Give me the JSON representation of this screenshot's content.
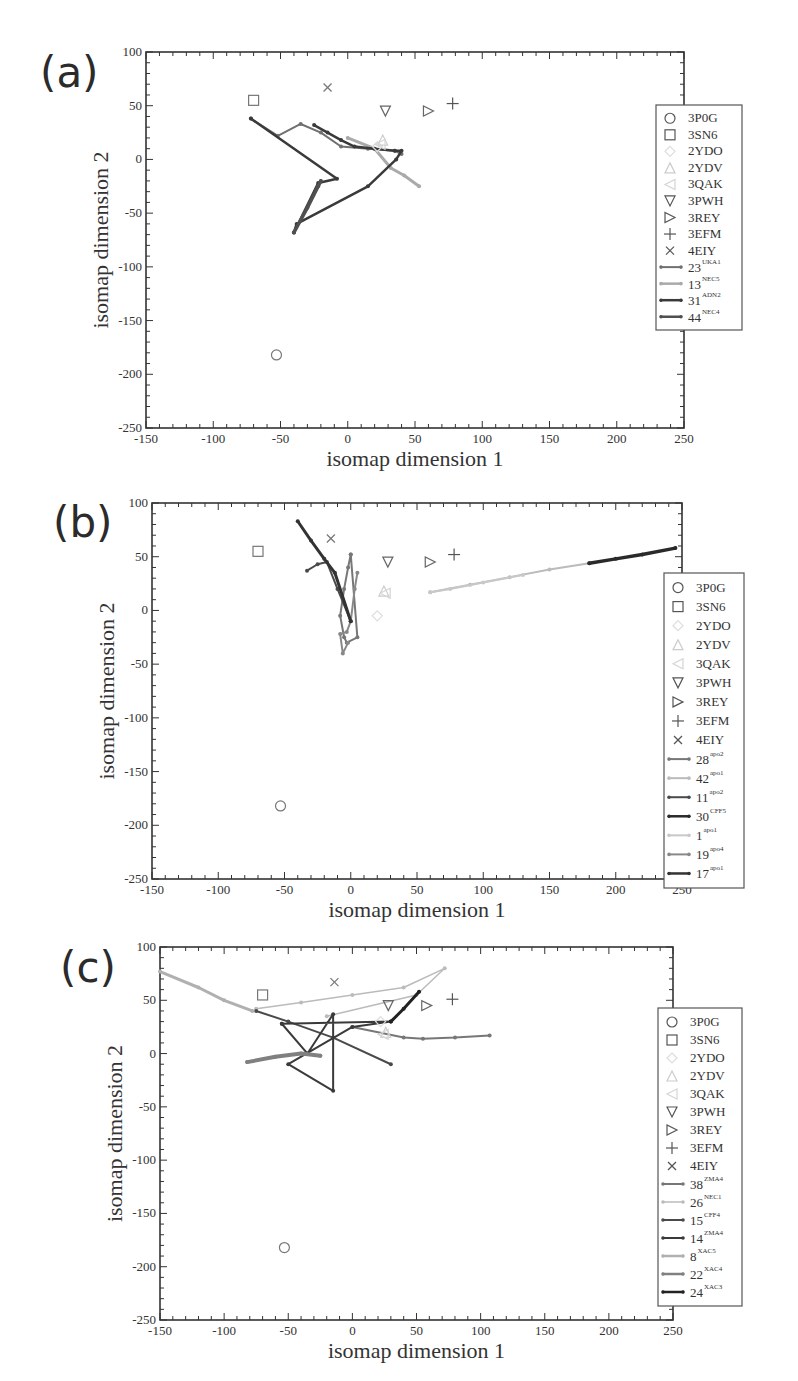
{
  "figure": {
    "panels": [
      {
        "label": "(a)"
      },
      {
        "label": "(b)"
      },
      {
        "label": "(c)"
      }
    ]
  },
  "chart_data": [
    {
      "type": "scatter",
      "panel": "(a)",
      "title": "",
      "xlabel": "isomap dimension 1",
      "ylabel": "isomap dimension 2",
      "xlim": [
        -150,
        250
      ],
      "ylim": [
        -250,
        100
      ],
      "xticks": [
        -150,
        -100,
        -50,
        0,
        50,
        100,
        150,
        200,
        250
      ],
      "yticks": [
        -250,
        -200,
        -150,
        -100,
        -50,
        0,
        50,
        100
      ],
      "grid": false,
      "legend_position": "right",
      "reference_structures": [
        {
          "name": "3P0G",
          "marker": "circle",
          "x": -53,
          "y": -182,
          "color": "#777777"
        },
        {
          "name": "3SN6",
          "marker": "square",
          "x": -70,
          "y": 55,
          "color": "#777777"
        },
        {
          "name": "2YDO",
          "marker": "diamond",
          "x": 22,
          "y": 12,
          "color": "#dddddd"
        },
        {
          "name": "2YDV",
          "marker": "triangle-up",
          "x": 26,
          "y": 18,
          "color": "#cccccc"
        },
        {
          "name": "3QAK",
          "marker": "triangle-left",
          "x": 24,
          "y": 14,
          "color": "#d5d5d5"
        },
        {
          "name": "3PWH",
          "marker": "triangle-down",
          "x": 28,
          "y": 45,
          "color": "#666666"
        },
        {
          "name": "3REY",
          "marker": "triangle-right",
          "x": 60,
          "y": 45,
          "color": "#666666"
        },
        {
          "name": "3EFM",
          "marker": "plus",
          "x": 78,
          "y": 52,
          "color": "#555555"
        },
        {
          "name": "4EIY",
          "marker": "x",
          "x": -15,
          "y": 67,
          "color": "#777777"
        }
      ],
      "series": [
        {
          "name": "23",
          "sup": "UKA1",
          "color": "#707070",
          "width": 2,
          "points": [
            [
              -72,
              38
            ],
            [
              -52,
              22
            ],
            [
              -35,
              33
            ],
            [
              -20,
              25
            ],
            [
              -5,
              12
            ],
            [
              15,
              10
            ],
            [
              35,
              8
            ],
            [
              40,
              5
            ]
          ]
        },
        {
          "name": "13",
          "sup": "NEC5",
          "color": "#aaaaaa",
          "width": 3,
          "points": [
            [
              0,
              20
            ],
            [
              20,
              10
            ],
            [
              32,
              -8
            ],
            [
              42,
              -15
            ],
            [
              53,
              -25
            ]
          ]
        },
        {
          "name": "31",
          "sup": "ADN2",
          "color": "#3a3a3a",
          "width": 2.5,
          "points": [
            [
              -25,
              32
            ],
            [
              -15,
              25
            ],
            [
              -5,
              18
            ],
            [
              5,
              12
            ],
            [
              20,
              10
            ],
            [
              35,
              8
            ],
            [
              40,
              8
            ],
            [
              36,
              0
            ],
            [
              15,
              -25
            ],
            [
              -38,
              -60
            ],
            [
              -40,
              -68
            ],
            [
              -22,
              -22
            ],
            [
              -8,
              -18
            ],
            [
              -72,
              38
            ]
          ]
        },
        {
          "name": "44",
          "sup": "NEC4",
          "color": "#505050",
          "width": 3.5,
          "points": [
            [
              -40,
              -68
            ],
            [
              -30,
              -45
            ],
            [
              -22,
              -25
            ],
            [
              -20,
              -20
            ]
          ]
        }
      ]
    },
    {
      "type": "scatter",
      "panel": "(b)",
      "title": "",
      "xlabel": "isomap dimension 1",
      "ylabel": "isomap dimension 2",
      "xlim": [
        -150,
        250
      ],
      "ylim": [
        -250,
        100
      ],
      "xticks": [
        -150,
        -100,
        -50,
        0,
        50,
        100,
        150,
        200,
        250
      ],
      "yticks": [
        -250,
        -200,
        -150,
        -100,
        -50,
        0,
        50,
        100
      ],
      "grid": false,
      "legend_position": "right",
      "reference_structures": [
        {
          "name": "3P0G",
          "marker": "circle",
          "x": -53,
          "y": -182,
          "color": "#777777"
        },
        {
          "name": "3SN6",
          "marker": "square",
          "x": -70,
          "y": 55,
          "color": "#777777"
        },
        {
          "name": "2YDO",
          "marker": "diamond",
          "x": 20,
          "y": -5,
          "color": "#dddddd"
        },
        {
          "name": "2YDV",
          "marker": "triangle-up",
          "x": 25,
          "y": 18,
          "color": "#cccccc"
        },
        {
          "name": "3QAK",
          "marker": "triangle-left",
          "x": 26,
          "y": 16,
          "color": "#d5d5d5"
        },
        {
          "name": "3PWH",
          "marker": "triangle-down",
          "x": 28,
          "y": 45,
          "color": "#666666"
        },
        {
          "name": "3REY",
          "marker": "triangle-right",
          "x": 60,
          "y": 45,
          "color": "#666666"
        },
        {
          "name": "3EFM",
          "marker": "plus",
          "x": 78,
          "y": 52,
          "color": "#555555"
        },
        {
          "name": "4EIY",
          "marker": "x",
          "x": -15,
          "y": 67,
          "color": "#777777"
        }
      ],
      "series": [
        {
          "name": "28",
          "sup": "apo2",
          "color": "#777777",
          "width": 2,
          "points": [
            [
              0,
              52
            ],
            [
              -2,
              40
            ],
            [
              -5,
              20
            ],
            [
              -8,
              -5
            ],
            [
              -5,
              -25
            ],
            [
              -3,
              -30
            ],
            [
              5,
              -25
            ],
            [
              0,
              52
            ]
          ]
        },
        {
          "name": "42",
          "sup": "apo1",
          "color": "#bbbbbb",
          "width": 2,
          "points": [
            [
              60,
              17
            ],
            [
              90,
              24
            ],
            [
              120,
              31
            ],
            [
              150,
              38
            ],
            [
              180,
              44
            ]
          ]
        },
        {
          "name": "11",
          "sup": "apo2",
          "color": "#4a4a4a",
          "width": 2,
          "points": [
            [
              -33,
              37
            ],
            [
              -25,
              43
            ],
            [
              -18,
              45
            ],
            [
              -10,
              20
            ],
            [
              0,
              -10
            ]
          ]
        },
        {
          "name": "30",
          "sup": "CFF5",
          "color": "#2a2a2a",
          "width": 3.5,
          "points": [
            [
              180,
              44
            ],
            [
              200,
              48
            ],
            [
              220,
              52
            ],
            [
              245,
              58
            ]
          ]
        },
        {
          "name": "1",
          "sup": "apo1",
          "color": "#c8c8c8",
          "width": 2,
          "points": [
            [
              60,
              17
            ],
            [
              75,
              20
            ],
            [
              100,
              26
            ],
            [
              130,
              33
            ]
          ]
        },
        {
          "name": "19",
          "sup": "apo4",
          "color": "#888888",
          "width": 2,
          "points": [
            [
              5,
              35
            ],
            [
              3,
              20
            ],
            [
              0,
              -10
            ],
            [
              -3,
              -20
            ],
            [
              -8,
              -22
            ],
            [
              -6,
              -40
            ],
            [
              -2,
              -30
            ]
          ]
        },
        {
          "name": "17",
          "sup": "apo1",
          "color": "#333333",
          "width": 3,
          "points": [
            [
              -40,
              83
            ],
            [
              -30,
              65
            ],
            [
              -20,
              48
            ],
            [
              -12,
              35
            ],
            [
              0,
              -10
            ]
          ]
        }
      ]
    },
    {
      "type": "scatter",
      "panel": "(c)",
      "title": "",
      "xlabel": "isomap dimension 1",
      "ylabel": "isomap dimension 2",
      "xlim": [
        -150,
        250
      ],
      "ylim": [
        -250,
        100
      ],
      "xticks": [
        -150,
        -100,
        -50,
        0,
        50,
        100,
        150,
        200,
        250
      ],
      "yticks": [
        -250,
        -200,
        -150,
        -100,
        -50,
        0,
        50,
        100
      ],
      "grid": false,
      "legend_position": "right",
      "reference_structures": [
        {
          "name": "3P0G",
          "marker": "circle",
          "x": -53,
          "y": -182,
          "color": "#777777"
        },
        {
          "name": "3SN6",
          "marker": "square",
          "x": -70,
          "y": 55,
          "color": "#777777"
        },
        {
          "name": "2YDO",
          "marker": "diamond",
          "x": 22,
          "y": 30,
          "color": "#dddddd"
        },
        {
          "name": "2YDV",
          "marker": "triangle-up",
          "x": 26,
          "y": 20,
          "color": "#cccccc"
        },
        {
          "name": "3QAK",
          "marker": "triangle-left",
          "x": 24,
          "y": 18,
          "color": "#d5d5d5"
        },
        {
          "name": "3PWH",
          "marker": "triangle-down",
          "x": 28,
          "y": 45,
          "color": "#666666"
        },
        {
          "name": "3REY",
          "marker": "triangle-right",
          "x": 58,
          "y": 45,
          "color": "#666666"
        },
        {
          "name": "3EFM",
          "marker": "plus",
          "x": 78,
          "y": 51,
          "color": "#555555"
        },
        {
          "name": "4EIY",
          "marker": "x",
          "x": -14,
          "y": 67,
          "color": "#777777"
        }
      ],
      "series": [
        {
          "name": "38",
          "sup": "ZMA4",
          "color": "#777777",
          "width": 2,
          "points": [
            [
              0,
              25
            ],
            [
              40,
              15
            ],
            [
              55,
              14
            ],
            [
              80,
              15
            ],
            [
              107,
              17
            ]
          ]
        },
        {
          "name": "26",
          "sup": "NEC1",
          "color": "#bbbbbb",
          "width": 1.5,
          "points": [
            [
              -75,
              42
            ],
            [
              -40,
              48
            ],
            [
              0,
              55
            ],
            [
              40,
              62
            ],
            [
              72,
              80
            ],
            [
              50,
              55
            ],
            [
              -20,
              35
            ]
          ]
        },
        {
          "name": "15",
          "sup": "CFF4",
          "color": "#4a4a4a",
          "width": 2,
          "points": [
            [
              -75,
              40
            ],
            [
              -50,
              30
            ],
            [
              -15,
              15
            ],
            [
              30,
              -10
            ]
          ]
        },
        {
          "name": "14",
          "sup": "ZMA4",
          "color": "#3a3a3a",
          "width": 2,
          "points": [
            [
              -55,
              28
            ],
            [
              -35,
              0
            ],
            [
              -15,
              37
            ],
            [
              -15,
              -35
            ],
            [
              -50,
              -10
            ],
            [
              0,
              25
            ],
            [
              30,
              30
            ],
            [
              -55,
              28
            ]
          ]
        },
        {
          "name": "8",
          "sup": "XAC5",
          "color": "#b0b0b0",
          "width": 3,
          "points": [
            [
              -150,
              77
            ],
            [
              -120,
              62
            ],
            [
              -100,
              50
            ],
            [
              -78,
              40
            ]
          ]
        },
        {
          "name": "22",
          "sup": "XAC4",
          "color": "#808080",
          "width": 4,
          "points": [
            [
              -82,
              -8
            ],
            [
              -60,
              -3
            ],
            [
              -40,
              0
            ],
            [
              -25,
              -2
            ]
          ]
        },
        {
          "name": "24",
          "sup": "XAC3",
          "color": "#222222",
          "width": 3,
          "points": [
            [
              30,
              30
            ],
            [
              40,
              42
            ],
            [
              52,
              58
            ]
          ]
        }
      ]
    }
  ]
}
